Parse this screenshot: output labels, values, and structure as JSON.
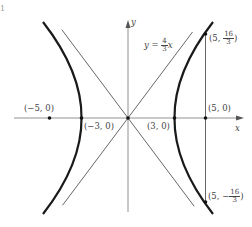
{
  "figure": {
    "corner_label": "1",
    "axes": {
      "x_label": "x",
      "y_label": "y"
    },
    "asymptote_label": {
      "lhs": "y",
      "eq": " = ",
      "num": "4",
      "den": "3",
      "var": "x"
    },
    "points": {
      "left_focus": "(−5, 0)",
      "left_vertex": "(−3, 0)",
      "right_vertex": "(3, 0)",
      "right_focus": "(5, 0)",
      "upper_end": {
        "prefix": "(5, ",
        "num": "16",
        "den": "3",
        "suffix": ")"
      },
      "lower_end": {
        "prefix": "(5, −",
        "num": "16",
        "den": "3",
        "suffix": ")"
      }
    },
    "hyperbola": {
      "a": 3,
      "b": 4,
      "c": 5,
      "equation": "x²/9 − y²/16 = 1"
    },
    "colors": {
      "curve": "#1a1a1a",
      "line": "#555555",
      "axis": "#777777",
      "text": "#444444"
    }
  }
}
